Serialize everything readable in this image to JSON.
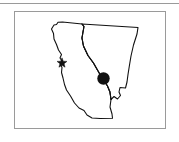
{
  "figure": {
    "name": "california-nevada-locator-map",
    "background_color": "#ffffff",
    "frame_color": "#9a9a9a",
    "outline_color": "#111111"
  },
  "top_rule": {
    "label": "horizontal-rule",
    "color": "#9a9a9a"
  },
  "map": {
    "frame_label": "map-border",
    "regions": [
      {
        "name": "California",
        "label": ""
      },
      {
        "name": "Nevada",
        "label": ""
      }
    ],
    "markers": [
      {
        "type": "star",
        "name": "coastal-site-marker",
        "label": "",
        "color": "#111111",
        "x": 62,
        "y": 63
      },
      {
        "type": "dot",
        "name": "primary-site-marker",
        "label": "",
        "color": "#111111",
        "x": 103.5,
        "y": 78.5,
        "radius": 6.2
      }
    ],
    "leader_line": {
      "name": "marker-leader-line",
      "color": "#111111"
    }
  }
}
